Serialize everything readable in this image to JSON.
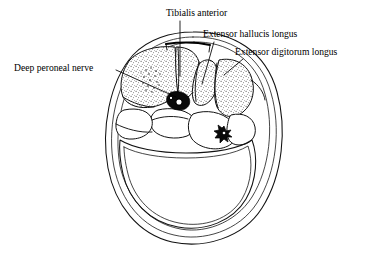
{
  "figure": {
    "background_color": "#ffffff",
    "ink_color": "#000000",
    "style": "line-drawing-with-stipple-shading"
  },
  "labels": [
    {
      "id": "deep-peroneal-nerve",
      "text": "Deep peroneal nerve",
      "text_x": 14,
      "text_y": 71,
      "anchor": "start",
      "leader": {
        "x1": 116,
        "y1": 70,
        "x2": 176,
        "y2": 97
      }
    },
    {
      "id": "tibialis-anterior",
      "text": "Tibialis anterior",
      "text_x": 166,
      "text_y": 16,
      "anchor": "start",
      "leader": {
        "x1": 180,
        "y1": 21,
        "x2": 180,
        "y2": 76
      }
    },
    {
      "id": "extensor-hallucis-longus",
      "text": "Extensor hallucis longus",
      "text_x": 203,
      "text_y": 37,
      "anchor": "start",
      "leader": {
        "x1": 214,
        "y1": 42,
        "x2": 202,
        "y2": 84
      }
    },
    {
      "id": "extensor-digitorum-longus",
      "text": "Extensor digitorum longus",
      "text_x": 235,
      "text_y": 55,
      "anchor": "start",
      "leader": {
        "x1": 243,
        "y1": 59,
        "x2": 224,
        "y2": 75
      }
    }
  ],
  "structures": {
    "outer_fascia_layers": 3,
    "anterior_compartment_shading": "stippled",
    "posterior_compartment_shading": "none",
    "marked_vessels": [
      {
        "id": "anterior-tibial-vessels",
        "x": 178,
        "y": 101,
        "kind": "hollow-circle-pair"
      },
      {
        "id": "peroneal-vessels",
        "x": 224,
        "y": 133,
        "kind": "stellate-dark"
      }
    ],
    "stipple_clusters": [
      {
        "id": "tibialis-anterior-stipple-cluster",
        "x": 152,
        "y": 76
      }
    ]
  }
}
